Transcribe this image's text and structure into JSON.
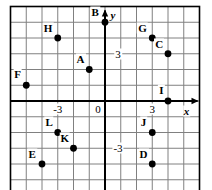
{
  "figure": {
    "kind": "coordinate-grid-scatter",
    "width": 212,
    "height": 190,
    "background_color": "#ffffff",
    "grid_color": "#808080",
    "axis_color": "#000000",
    "point_color": "#000000"
  },
  "chart_data": {
    "type": "scatter",
    "title": "",
    "xlabel": "x",
    "ylabel": "y",
    "xlim": [
      -6,
      6
    ],
    "ylim": [
      -6,
      6
    ],
    "grid": true,
    "legend": "none",
    "xticks": [
      -3,
      0,
      3
    ],
    "xtick_labels": [
      "-3",
      "0",
      "3"
    ],
    "yticks": [
      -3,
      3
    ],
    "ytick_labels": [
      "-3",
      "3"
    ],
    "points": [
      {
        "label": "A",
        "x": -1,
        "y": 2,
        "label_dx": -0.55,
        "label_dy": 0.65
      },
      {
        "label": "B",
        "x": 0,
        "y": 5,
        "label_dx": -0.62,
        "label_dy": 0.62
      },
      {
        "label": "C",
        "x": 4,
        "y": 3,
        "label_dx": -0.55,
        "label_dy": 0.65
      },
      {
        "label": "D",
        "x": 3,
        "y": -4,
        "label_dx": -0.55,
        "label_dy": 0.65
      },
      {
        "label": "E",
        "x": -4,
        "y": -4,
        "label_dx": -0.62,
        "label_dy": 0.62
      },
      {
        "label": "F",
        "x": -5,
        "y": 1,
        "label_dx": -0.55,
        "label_dy": 0.72
      },
      {
        "label": "G",
        "x": 3,
        "y": 4,
        "label_dx": -0.62,
        "label_dy": 0.62
      },
      {
        "label": "H",
        "x": -3,
        "y": 4,
        "label_dx": -0.62,
        "label_dy": 0.62
      },
      {
        "label": "I",
        "x": 4,
        "y": 0,
        "label_dx": -0.42,
        "label_dy": 0.68
      },
      {
        "label": "J",
        "x": 3,
        "y": -2,
        "label_dx": -0.55,
        "label_dy": 0.68
      },
      {
        "label": "K",
        "x": -2,
        "y": -3,
        "label_dx": -0.55,
        "label_dy": 0.68
      },
      {
        "label": "L",
        "x": -3,
        "y": -2,
        "label_dx": -0.55,
        "label_dy": 0.68
      }
    ]
  },
  "axes": {
    "x_axis_name": "x",
    "y_axis_name": "y",
    "origin_label": "0"
  }
}
